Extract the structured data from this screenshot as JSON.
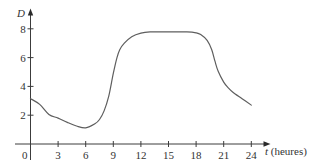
{
  "chart_data": {
    "type": "line",
    "title": "",
    "xlabel": "t (heures)",
    "xlabel_var": "t",
    "xlabel_unit": " (heures)",
    "ylabel": "D",
    "origin_label": "0",
    "x_ticks": [
      3,
      6,
      9,
      12,
      15,
      18,
      21,
      24
    ],
    "y_ticks": [
      2,
      4,
      6,
      8
    ],
    "xlim": [
      0,
      24
    ],
    "ylim": [
      0,
      8
    ],
    "grid": false,
    "legend": null,
    "series": [
      {
        "name": "D(t)",
        "x": [
          0,
          1,
          2,
          3,
          4,
          5,
          6,
          7,
          7.5,
          8,
          8.5,
          9,
          9.4,
          9.7,
          10.2,
          11,
          12,
          13,
          15,
          17,
          18,
          18.5,
          19.2,
          19.7,
          20.05,
          20.4,
          21,
          21.5,
          22,
          23,
          24
        ],
        "y": [
          3.15,
          2.75,
          2.05,
          1.8,
          1.5,
          1.25,
          1.12,
          1.4,
          1.7,
          2.3,
          3.3,
          4.9,
          6.0,
          6.55,
          7.0,
          7.45,
          7.7,
          7.78,
          7.78,
          7.78,
          7.72,
          7.6,
          7.2,
          6.55,
          5.75,
          5.05,
          4.3,
          3.9,
          3.6,
          3.15,
          2.7
        ]
      }
    ]
  },
  "colors": {
    "curve": "#5e5e5e",
    "axis": "#3c3c3c",
    "text": "#333333"
  }
}
